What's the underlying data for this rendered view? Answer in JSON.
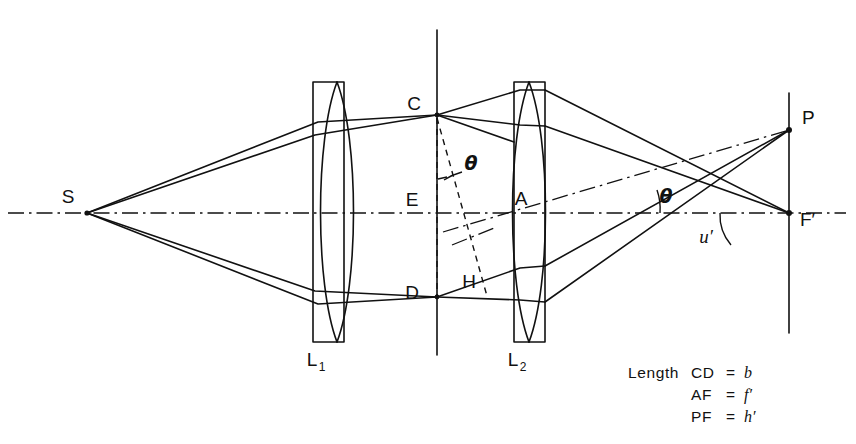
{
  "figure": {
    "domain": "Diagram",
    "background_color": "#ffffff",
    "line_color": "#111111",
    "width": 856,
    "height": 444
  },
  "points": [
    {
      "id": "S",
      "label": "S",
      "x": 87,
      "y": 213,
      "label_x": 68,
      "label_y": 203,
      "desc": "source-point"
    },
    {
      "id": "C",
      "label": "C",
      "x": 437,
      "y": 115,
      "label_x": 414,
      "label_y": 110,
      "desc": "stop-upper-edge"
    },
    {
      "id": "E",
      "label": "E",
      "x": 437,
      "y": 213,
      "label_x": 412,
      "label_y": 206,
      "desc": "stop-axis-point"
    },
    {
      "id": "D",
      "label": "D",
      "x": 437,
      "y": 297,
      "label_x": 412,
      "label_y": 299,
      "desc": "stop-lower-edge"
    },
    {
      "id": "H",
      "label": "H",
      "x": 480,
      "y": 283,
      "label_x": 469,
      "label_y": 288,
      "desc": "perpendicular-foot"
    },
    {
      "id": "A",
      "label": "A",
      "x": 529,
      "y": 213,
      "label_x": 521,
      "label_y": 205,
      "desc": "second-lens-center"
    },
    {
      "id": "P",
      "label": "P",
      "x": 789,
      "y": 130,
      "label_x": 802,
      "label_y": 124,
      "desc": "image-point"
    },
    {
      "id": "F",
      "label": "F′",
      "x": 789,
      "y": 213,
      "label_x": 800,
      "label_y": 226,
      "desc": "rear-focal-point"
    }
  ],
  "lenses": [
    {
      "id": "L1",
      "label": "L",
      "subscript": "1",
      "label_x": 317,
      "label_y": 366,
      "rect": {
        "x": 313,
        "y": 82,
        "width": 31,
        "height": 260
      },
      "bulge": 22,
      "desc": "first-lens"
    },
    {
      "id": "L2",
      "label": "L",
      "subscript": "2",
      "label_x": 518,
      "label_y": 366,
      "rect": {
        "x": 514,
        "y": 82,
        "width": 31,
        "height": 260
      },
      "bulge": 22,
      "desc": "second-lens"
    }
  ],
  "angle_labels": [
    {
      "id": "theta-stop",
      "text": "θ",
      "x": 471,
      "y": 170,
      "desc": "theta-at-stop"
    },
    {
      "id": "theta-chief",
      "text": "θ",
      "x": 666,
      "y": 203,
      "desc": "theta-at-axis"
    },
    {
      "id": "u-prime",
      "text": "u′",
      "x": 706,
      "y": 243,
      "desc": "marginal-angle-u-prime"
    }
  ],
  "axis": {
    "y": 213,
    "x_start": 8,
    "x_end": 846,
    "style": "dash-dot",
    "desc": "optical-axis"
  },
  "vertical_lines": [
    {
      "id": "stop-plane",
      "x": 437,
      "y1": 30,
      "y2": 355,
      "desc": "field-stop-plane"
    },
    {
      "id": "image-plane",
      "x": 789,
      "y1": 93,
      "y2": 333,
      "desc": "image-plane"
    }
  ],
  "legend": {
    "lines": [
      {
        "prefix": "Length",
        "pair": "CD",
        "eq": "=",
        "value": "b"
      },
      {
        "prefix": "",
        "pair": "AF",
        "eq": "=",
        "value": "f′"
      },
      {
        "prefix": "",
        "pair": "PF",
        "eq": "=",
        "value": "h′"
      }
    ],
    "x": 628,
    "y": 378,
    "line_height": 22
  }
}
